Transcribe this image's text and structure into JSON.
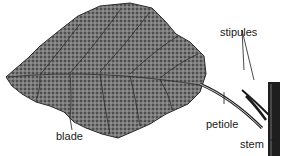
{
  "diagram": {
    "labels": {
      "blade": "blade",
      "petiole": "petiole",
      "stipules": "stipules",
      "stem": "stem"
    },
    "colors": {
      "leaf_fill": "#6e6e6e",
      "vein": "#2a2a2a",
      "line": "#1a1a1a",
      "background": "#ffffff"
    }
  }
}
